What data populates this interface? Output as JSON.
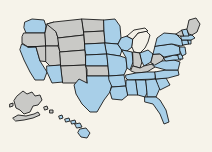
{
  "map": {
    "title": "United States choropleth map",
    "projection": "albers-usa",
    "background_color": "#f6f3ea",
    "border_color": "#1a1a1a",
    "legend": {
      "visible": false,
      "categories": [
        {
          "key": "highlighted",
          "label": "Highlighted",
          "color": "#a8cfe8"
        },
        {
          "key": "not_highlighted",
          "label": "Not highlighted",
          "color": "#c9c9c6"
        },
        {
          "key": "unfilled",
          "label": "Unfilled",
          "color": "#f3f0e7"
        }
      ]
    },
    "counts": {
      "highlighted": 32,
      "not_highlighted": 18,
      "unfilled": 1
    },
    "states": [
      {
        "code": "WA",
        "name": "Washington",
        "status": "highlighted",
        "color": "#a8cfe8"
      },
      {
        "code": "OR",
        "name": "Oregon",
        "status": "not_highlighted",
        "color": "#c9c9c6"
      },
      {
        "code": "CA",
        "name": "California",
        "status": "highlighted",
        "color": "#a8cfe8"
      },
      {
        "code": "NV",
        "name": "Nevada",
        "status": "not_highlighted",
        "color": "#c9c9c6"
      },
      {
        "code": "ID",
        "name": "Idaho",
        "status": "not_highlighted",
        "color": "#c9c9c6"
      },
      {
        "code": "MT",
        "name": "Montana",
        "status": "not_highlighted",
        "color": "#c9c9c6"
      },
      {
        "code": "WY",
        "name": "Wyoming",
        "status": "not_highlighted",
        "color": "#c9c9c6"
      },
      {
        "code": "UT",
        "name": "Utah",
        "status": "not_highlighted",
        "color": "#c9c9c6"
      },
      {
        "code": "AZ",
        "name": "Arizona",
        "status": "highlighted",
        "color": "#a8cfe8"
      },
      {
        "code": "CO",
        "name": "Colorado",
        "status": "not_highlighted",
        "color": "#c9c9c6"
      },
      {
        "code": "NM",
        "name": "New Mexico",
        "status": "not_highlighted",
        "color": "#c9c9c6"
      },
      {
        "code": "ND",
        "name": "North Dakota",
        "status": "not_highlighted",
        "color": "#c9c9c6"
      },
      {
        "code": "SD",
        "name": "South Dakota",
        "status": "not_highlighted",
        "color": "#c9c9c6"
      },
      {
        "code": "NE",
        "name": "Nebraska",
        "status": "highlighted",
        "color": "#a8cfe8"
      },
      {
        "code": "KS",
        "name": "Kansas",
        "status": "highlighted",
        "color": "#a8cfe8"
      },
      {
        "code": "OK",
        "name": "Oklahoma",
        "status": "not_highlighted",
        "color": "#c9c9c6"
      },
      {
        "code": "TX",
        "name": "Texas",
        "status": "highlighted",
        "color": "#a8cfe8"
      },
      {
        "code": "MN",
        "name": "Minnesota",
        "status": "highlighted",
        "color": "#a8cfe8"
      },
      {
        "code": "IA",
        "name": "Iowa",
        "status": "highlighted",
        "color": "#a8cfe8"
      },
      {
        "code": "MO",
        "name": "Missouri",
        "status": "highlighted",
        "color": "#a8cfe8"
      },
      {
        "code": "AR",
        "name": "Arkansas",
        "status": "highlighted",
        "color": "#a8cfe8"
      },
      {
        "code": "LA",
        "name": "Louisiana",
        "status": "highlighted",
        "color": "#a8cfe8"
      },
      {
        "code": "WI",
        "name": "Wisconsin",
        "status": "highlighted",
        "color": "#a8cfe8"
      },
      {
        "code": "IL",
        "name": "Illinois",
        "status": "highlighted",
        "color": "#a8cfe8"
      },
      {
        "code": "MI",
        "name": "Michigan",
        "status": "unfilled",
        "color": "#f3f0e7"
      },
      {
        "code": "IN",
        "name": "Indiana",
        "status": "not_highlighted",
        "color": "#c9c9c6"
      },
      {
        "code": "OH",
        "name": "Ohio",
        "status": "highlighted",
        "color": "#a8cfe8"
      },
      {
        "code": "KY",
        "name": "Kentucky",
        "status": "not_highlighted",
        "color": "#c9c9c6"
      },
      {
        "code": "TN",
        "name": "Tennessee",
        "status": "highlighted",
        "color": "#a8cfe8"
      },
      {
        "code": "MS",
        "name": "Mississippi",
        "status": "highlighted",
        "color": "#a8cfe8"
      },
      {
        "code": "AL",
        "name": "Alabama",
        "status": "highlighted",
        "color": "#a8cfe8"
      },
      {
        "code": "GA",
        "name": "Georgia",
        "status": "highlighted",
        "color": "#a8cfe8"
      },
      {
        "code": "FL",
        "name": "Florida",
        "status": "highlighted",
        "color": "#a8cfe8"
      },
      {
        "code": "SC",
        "name": "South Carolina",
        "status": "highlighted",
        "color": "#a8cfe8"
      },
      {
        "code": "NC",
        "name": "North Carolina",
        "status": "highlighted",
        "color": "#a8cfe8"
      },
      {
        "code": "VA",
        "name": "Virginia",
        "status": "highlighted",
        "color": "#a8cfe8"
      },
      {
        "code": "WV",
        "name": "West Virginia",
        "status": "not_highlighted",
        "color": "#c9c9c6"
      },
      {
        "code": "MD",
        "name": "Maryland",
        "status": "highlighted",
        "color": "#a8cfe8"
      },
      {
        "code": "DE",
        "name": "Delaware",
        "status": "highlighted",
        "color": "#a8cfe8"
      },
      {
        "code": "PA",
        "name": "Pennsylvania",
        "status": "highlighted",
        "color": "#a8cfe8"
      },
      {
        "code": "NJ",
        "name": "New Jersey",
        "status": "highlighted",
        "color": "#a8cfe8"
      },
      {
        "code": "NY",
        "name": "New York",
        "status": "highlighted",
        "color": "#a8cfe8"
      },
      {
        "code": "CT",
        "name": "Connecticut",
        "status": "highlighted",
        "color": "#a8cfe8"
      },
      {
        "code": "RI",
        "name": "Rhode Island",
        "status": "highlighted",
        "color": "#a8cfe8"
      },
      {
        "code": "MA",
        "name": "Massachusetts",
        "status": "highlighted",
        "color": "#a8cfe8"
      },
      {
        "code": "VT",
        "name": "Vermont",
        "status": "not_highlighted",
        "color": "#c9c9c6"
      },
      {
        "code": "NH",
        "name": "New Hampshire",
        "status": "highlighted",
        "color": "#a8cfe8"
      },
      {
        "code": "ME",
        "name": "Maine",
        "status": "not_highlighted",
        "color": "#c9c9c6"
      },
      {
        "code": "AK",
        "name": "Alaska",
        "status": "not_highlighted",
        "color": "#c9c9c6"
      },
      {
        "code": "HI",
        "name": "Hawaii",
        "status": "highlighted",
        "color": "#a8cfe8"
      }
    ]
  }
}
